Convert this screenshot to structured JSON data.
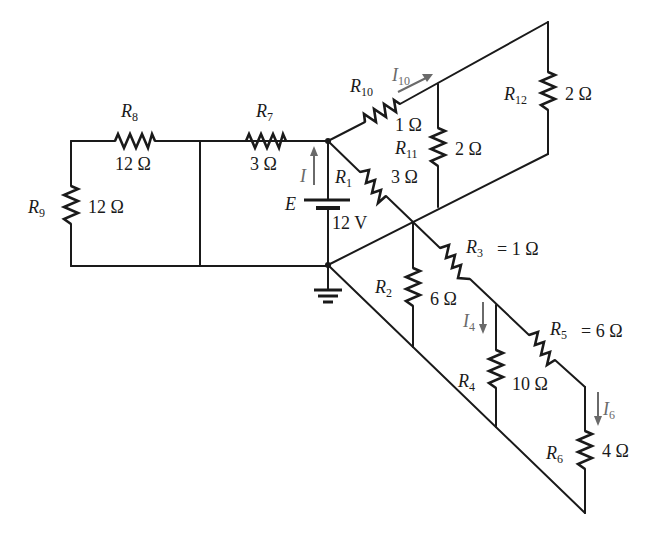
{
  "circuit": {
    "source": {
      "name": "E",
      "value": "12 V",
      "current": "I"
    },
    "resistors": [
      {
        "id": "R1",
        "label": "R",
        "sub": "1",
        "value": "3 Ω"
      },
      {
        "id": "R2",
        "label": "R",
        "sub": "2",
        "value": "6 Ω"
      },
      {
        "id": "R3",
        "label": "R",
        "sub": "3",
        "value": "= 1 Ω"
      },
      {
        "id": "R4",
        "label": "R",
        "sub": "4",
        "value": "10 Ω"
      },
      {
        "id": "R5",
        "label": "R",
        "sub": "5",
        "value": "= 6 Ω"
      },
      {
        "id": "R6",
        "label": "R",
        "sub": "6",
        "value": "4 Ω"
      },
      {
        "id": "R7",
        "label": "R",
        "sub": "7",
        "value": "3 Ω"
      },
      {
        "id": "R8",
        "label": "R",
        "sub": "8",
        "value": "12 Ω"
      },
      {
        "id": "R9",
        "label": "R",
        "sub": "9",
        "value": "12 Ω"
      },
      {
        "id": "R10",
        "label": "R",
        "sub": "10",
        "value": "1 Ω"
      },
      {
        "id": "R11",
        "label": "R",
        "sub": "11",
        "value": "2 Ω"
      },
      {
        "id": "R12",
        "label": "R",
        "sub": "12",
        "value": "2 Ω"
      }
    ],
    "currents": [
      {
        "id": "I",
        "label": "I",
        "sub": ""
      },
      {
        "id": "I4",
        "label": "I",
        "sub": "4"
      },
      {
        "id": "I6",
        "label": "I",
        "sub": "6"
      },
      {
        "id": "I10",
        "label": "I",
        "sub": "10"
      }
    ],
    "ground": "ground-symbol",
    "colors": {
      "wire": "#1a1a1a",
      "current_arrow": "#6a6a6a",
      "background": "#ffffff"
    }
  }
}
